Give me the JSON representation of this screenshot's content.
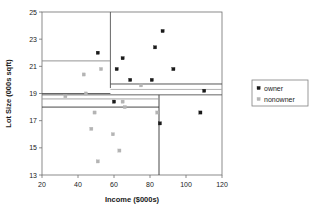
{
  "chart_data": {
    "type": "scatter",
    "title": "",
    "xlabel": "Income ($000s)",
    "ylabel": "Lot Size (000s sqft)",
    "xlim": [
      20,
      120
    ],
    "ylim": [
      13,
      25
    ],
    "xticks": [
      20,
      40,
      60,
      80,
      100,
      120
    ],
    "yticks": [
      13,
      15,
      17,
      19,
      21,
      23,
      25
    ],
    "grid": false,
    "legend_position": "right",
    "series": [
      {
        "name": "owner",
        "color": "#1a1a1a",
        "marker": "square",
        "points": [
          {
            "x": 60.0,
            "y": 18.4
          },
          {
            "x": 85.5,
            "y": 16.8
          },
          {
            "x": 64.8,
            "y": 21.6
          },
          {
            "x": 61.5,
            "y": 20.8
          },
          {
            "x": 87.0,
            "y": 23.6
          },
          {
            "x": 110.1,
            "y": 19.2
          },
          {
            "x": 108.0,
            "y": 17.6
          },
          {
            "x": 82.8,
            "y": 22.4
          },
          {
            "x": 69.0,
            "y": 20.0
          },
          {
            "x": 93.0,
            "y": 20.8
          },
          {
            "x": 51.0,
            "y": 22.0
          },
          {
            "x": 81.0,
            "y": 20.0
          }
        ]
      },
      {
        "name": "nonowner",
        "color": "#b4b4b4",
        "marker": "square",
        "points": [
          {
            "x": 75.0,
            "y": 19.6
          },
          {
            "x": 52.8,
            "y": 20.8
          },
          {
            "x": 64.8,
            "y": 18.4
          },
          {
            "x": 43.2,
            "y": 20.4
          },
          {
            "x": 84.0,
            "y": 17.6
          },
          {
            "x": 49.2,
            "y": 17.6
          },
          {
            "x": 59.4,
            "y": 16.0
          },
          {
            "x": 66.0,
            "y": 18.0
          },
          {
            "x": 47.4,
            "y": 16.4
          },
          {
            "x": 33.0,
            "y": 18.8
          },
          {
            "x": 51.0,
            "y": 14.0
          },
          {
            "x": 63.0,
            "y": 14.8
          },
          {
            "x": 44.4,
            "y": 19.0
          }
        ]
      }
    ],
    "partition_lines": [
      {
        "orientation": "vertical",
        "x": 58.0,
        "y_from": 19.4,
        "y_to": 25.0,
        "color": "#555555"
      },
      {
        "orientation": "vertical",
        "x": 85.0,
        "y_from": 13.0,
        "y_to": 18.9,
        "color": "#333333"
      },
      {
        "orientation": "horizontal",
        "y": 21.4,
        "x_from": 20.0,
        "x_to": 58.0,
        "color": "#888888"
      },
      {
        "orientation": "horizontal",
        "y": 19.0,
        "x_from": 20.0,
        "x_to": 58.0,
        "color": "#555555"
      },
      {
        "orientation": "horizontal",
        "y": 19.7,
        "x_from": 58.0,
        "x_to": 120.0,
        "color": "#444444"
      },
      {
        "orientation": "horizontal",
        "y": 19.3,
        "x_from": 58.0,
        "x_to": 120.0,
        "color": "#aaaaaa"
      },
      {
        "orientation": "horizontal",
        "y": 18.9,
        "x_from": 20.0,
        "x_to": 120.0,
        "color": "#555555"
      },
      {
        "orientation": "horizontal",
        "y": 18.6,
        "x_from": 20.0,
        "x_to": 85.0,
        "color": "#999999"
      },
      {
        "orientation": "horizontal",
        "y": 18.0,
        "x_from": 20.0,
        "x_to": 85.0,
        "color": "#333333"
      }
    ]
  },
  "legend": {
    "items": [
      {
        "label": "owner",
        "color": "#1a1a1a"
      },
      {
        "label": "nonowner",
        "color": "#b4b4b4"
      }
    ]
  }
}
